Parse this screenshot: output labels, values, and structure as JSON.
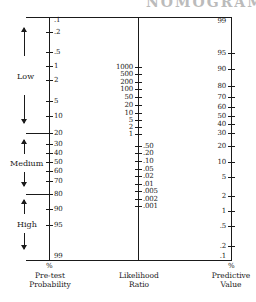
{
  "header": {
    "cut_title": "NOMOGRAM"
  },
  "axes": {
    "pretest": {
      "caption_line1": "Pre-test",
      "caption_line2": "Probability",
      "unit": "%",
      "ticks": [
        {
          "label": ".1",
          "y": 20
        },
        {
          "label": ".2",
          "y": 32
        },
        {
          "label": ".5",
          "y": 52
        },
        {
          "label": "1",
          "y": 66
        },
        {
          "label": "2",
          "y": 80
        },
        {
          "label": "5",
          "y": 101
        },
        {
          "label": "10",
          "y": 116
        },
        {
          "label": "20",
          "y": 133
        },
        {
          "label": "30",
          "y": 144
        },
        {
          "label": "40",
          "y": 153
        },
        {
          "label": "50",
          "y": 162
        },
        {
          "label": "60",
          "y": 171
        },
        {
          "label": "70",
          "y": 181
        },
        {
          "label": "80",
          "y": 194
        },
        {
          "label": "90",
          "y": 209
        },
        {
          "label": "95",
          "y": 225
        },
        {
          "label": "99",
          "y": 256
        }
      ],
      "bands": [
        {
          "label": "Low",
          "y": 76
        },
        {
          "label": "Medium",
          "y": 163
        },
        {
          "label": "High",
          "y": 224
        }
      ]
    },
    "likelihood": {
      "caption_line1": "Likelihood",
      "caption_line2": "Ratio",
      "ticks_above": [
        {
          "label": "1000",
          "y": 67
        },
        {
          "label": "500",
          "y": 74
        },
        {
          "label": "200",
          "y": 82
        },
        {
          "label": "100",
          "y": 89
        },
        {
          "label": "50",
          "y": 97
        },
        {
          "label": "20",
          "y": 105
        },
        {
          "label": "10",
          "y": 113
        },
        {
          "label": "5",
          "y": 120
        },
        {
          "label": "2",
          "y": 127
        },
        {
          "label": "1",
          "y": 134
        }
      ],
      "ticks_below": [
        {
          "label": ".50",
          "y": 146
        },
        {
          "label": ".20",
          "y": 153
        },
        {
          "label": ".10",
          "y": 161
        },
        {
          "label": ".05",
          "y": 169
        },
        {
          "label": ".02",
          "y": 176
        },
        {
          "label": ".01",
          "y": 184
        },
        {
          "label": ".005",
          "y": 191
        },
        {
          "label": ".002",
          "y": 199
        },
        {
          "label": ".001",
          "y": 206
        }
      ]
    },
    "predictive": {
      "caption_line1": "Predictive",
      "caption_line2": "Value",
      "unit": "%",
      "ticks": [
        {
          "label": "99",
          "y": 21
        },
        {
          "label": "95",
          "y": 53
        },
        {
          "label": "90",
          "y": 69
        },
        {
          "label": "80",
          "y": 86
        },
        {
          "label": "70",
          "y": 97
        },
        {
          "label": "60",
          "y": 107
        },
        {
          "label": "50",
          "y": 116
        },
        {
          "label": "40",
          "y": 124
        },
        {
          "label": "30",
          "y": 133
        },
        {
          "label": "20",
          "y": 146
        },
        {
          "label": "10",
          "y": 162
        },
        {
          "label": "5",
          "y": 177
        },
        {
          "label": "2",
          "y": 196
        },
        {
          "label": "1",
          "y": 211
        },
        {
          "label": ".5",
          "y": 226
        },
        {
          "label": ".2",
          "y": 246
        },
        {
          "label": ".1",
          "y": 256
        }
      ]
    }
  }
}
